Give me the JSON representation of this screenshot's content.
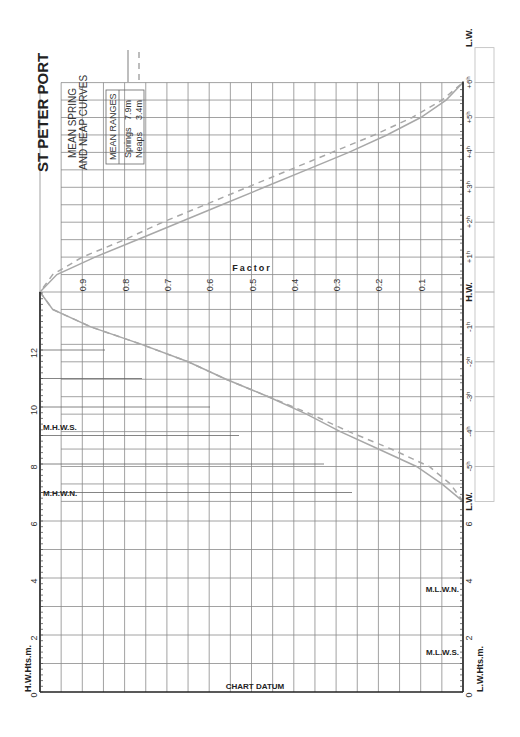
{
  "title": "ST PETER PORT",
  "subtitle_line1": "MEAN SPRING",
  "subtitle_line2": "AND NEAP CURVES",
  "legend": {
    "heading": "MEAN RANGES",
    "items": [
      {
        "name": "Springs",
        "value": "7.9m",
        "style": "solid"
      },
      {
        "name": "Neaps",
        "value": "3.4m",
        "style": "dashed"
      }
    ]
  },
  "axes": {
    "left_label": "H.W.Hts.m.",
    "right_label": "L.W.Hts.m.",
    "factor_label": "Factor",
    "datum_label": "CHART DATUM",
    "height_ticks": [
      "0",
      "2",
      "4",
      "6",
      "8",
      "10",
      "12"
    ],
    "factor_ticks": [
      "0.9",
      "0.8",
      "0.7",
      "0.6",
      "0.5",
      "0.4",
      "0.3",
      "0.2",
      "0.1"
    ],
    "time_ticks_rising": [
      "L.W.",
      "-5ʰ",
      "-4ʰ",
      "-3ʰ",
      "-2ʰ",
      "-1ʰ",
      "H.W."
    ],
    "time_ticks_falling": [
      "+1ʰ",
      "+2ʰ",
      "+3ʰ",
      "+4ʰ",
      "+5ʰ",
      "+6ʰ",
      "L.W."
    ],
    "hw_marks": [
      {
        "label": "M.H.W.S.",
        "height": 9.3
      },
      {
        "label": "M.H.W.N.",
        "height": 7.0
      }
    ],
    "lw_marks": [
      {
        "label": "M.L.W.N.",
        "height": 3.6
      },
      {
        "label": "M.L.W.S.",
        "height": 1.4
      }
    ]
  },
  "colors": {
    "curve": "#a8a8a8",
    "grid": "#8a8a8a",
    "axis": "#222222"
  },
  "chart_data": {
    "type": "line",
    "xlabel": "Time relative to H.W. (hours)",
    "ylabel": "Factor",
    "ylim": [
      0,
      1
    ],
    "x": [
      -6,
      -5.5,
      -5,
      -4.5,
      -4,
      -3.5,
      -3,
      -2.5,
      -2,
      -1.5,
      -1,
      -0.5,
      0,
      0.5,
      1,
      1.5,
      2,
      2.5,
      3,
      3.5,
      4,
      4.5,
      5,
      5.5,
      6
    ],
    "series": [
      {
        "name": "Springs (7.9m)",
        "style": "solid",
        "values": [
          0.0,
          0.05,
          0.11,
          0.2,
          0.29,
          0.37,
          0.46,
          0.56,
          0.65,
          0.76,
          0.88,
          0.97,
          1.0,
          0.96,
          0.87,
          0.77,
          0.67,
          0.57,
          0.47,
          0.37,
          0.27,
          0.18,
          0.1,
          0.04,
          0.0
        ]
      },
      {
        "name": "Neaps (3.4m)",
        "style": "dashed",
        "values": [
          0.0,
          0.03,
          0.08,
          0.17,
          0.27,
          0.36,
          0.46,
          0.56,
          0.65,
          0.76,
          0.88,
          0.97,
          1.0,
          0.97,
          0.9,
          0.8,
          0.71,
          0.61,
          0.51,
          0.41,
          0.31,
          0.21,
          0.12,
          0.05,
          0.0
        ]
      }
    ],
    "height_axis": {
      "label": "H.W.Hts.m. / L.W.Hts.m.",
      "range": [
        0,
        14
      ],
      "ticks": [
        0,
        2,
        4,
        6,
        8,
        10,
        12
      ]
    },
    "factor_ticks": [
      0.1,
      0.2,
      0.3,
      0.4,
      0.5,
      0.6,
      0.7,
      0.8,
      0.9
    ],
    "grid": true,
    "orientation": "rotated 90° counter-clockwise"
  }
}
